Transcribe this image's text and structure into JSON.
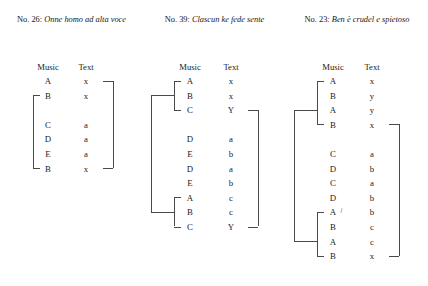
{
  "figure": {
    "type": "structural-analysis-diagram"
  },
  "columns": [
    {
      "id": "col-26",
      "caption_number": "No. 26:",
      "caption_title": "Onne homo ad alta voce",
      "headers": {
        "music": "Music",
        "text": "Text"
      },
      "rows": [
        {
          "music": "A",
          "text": "x"
        },
        {
          "music": "B",
          "text": "x"
        },
        {
          "music": "",
          "text": ""
        },
        {
          "music": "C",
          "text": "a"
        },
        {
          "music": "D",
          "text": "a"
        },
        {
          "music": "E",
          "text": "a"
        },
        {
          "music": "B",
          "text": "x"
        }
      ],
      "music_brackets": [
        {
          "from_row": 1,
          "to_row": 6,
          "nested": false
        }
      ],
      "text_brackets": [
        {
          "from_row": 0,
          "to_row": 6
        }
      ]
    },
    {
      "id": "col-39",
      "caption_number": "No. 39:",
      "caption_title": "Clascun ke fede sente",
      "headers": {
        "music": "Music",
        "text": "Text"
      },
      "rows": [
        {
          "music": "A",
          "text": "x"
        },
        {
          "music": "B",
          "text": "x"
        },
        {
          "music": "C",
          "text": "Y"
        },
        {
          "music": "",
          "text": ""
        },
        {
          "music": "D",
          "text": "a"
        },
        {
          "music": "E",
          "text": "b"
        },
        {
          "music": "D",
          "text": "a"
        },
        {
          "music": "E",
          "text": "b"
        },
        {
          "music": "A",
          "text": "c"
        },
        {
          "music": "B",
          "text": "c"
        },
        {
          "music": "C",
          "text": "Y"
        }
      ],
      "music_brackets": [
        {
          "from_row": 0,
          "to_row": 2,
          "nested": true
        },
        {
          "from_row": 8,
          "to_row": 10,
          "nested": true
        }
      ],
      "music_outer_bracket": {
        "from_row": 1,
        "to_row": 9
      },
      "text_brackets": [
        {
          "from_row": 2,
          "to_row": 10
        }
      ]
    },
    {
      "id": "col-23",
      "caption_number": "No. 23:",
      "caption_title": "Ben è crudel e spietoso",
      "headers": {
        "music": "Music",
        "text": "Text"
      },
      "rows": [
        {
          "music": "A",
          "text": "x"
        },
        {
          "music": "B",
          "text": "y"
        },
        {
          "music": "A",
          "text": "y"
        },
        {
          "music": "B",
          "text": "x"
        },
        {
          "music": "",
          "text": ""
        },
        {
          "music": "C",
          "text": "a"
        },
        {
          "music": "D",
          "text": "b"
        },
        {
          "music": "C",
          "text": "a"
        },
        {
          "music": "D",
          "text": "b"
        },
        {
          "music": "A",
          "text": "b"
        },
        {
          "music": "B",
          "text": "c"
        },
        {
          "music": "A",
          "text": "c"
        },
        {
          "music": "B",
          "text": "x"
        }
      ],
      "music_brackets": [
        {
          "from_row": 0,
          "to_row": 3,
          "nested": true
        },
        {
          "from_row": 9,
          "to_row": 12,
          "nested": true
        }
      ],
      "music_outer_bracket": {
        "from_row": 2,
        "to_row": 11
      },
      "text_brackets": [
        {
          "from_row": 3,
          "to_row": 12
        }
      ]
    }
  ],
  "colors": {
    "ink": "#1c1c1c",
    "rule": "#4a4a4a",
    "background": "#ffffff"
  }
}
